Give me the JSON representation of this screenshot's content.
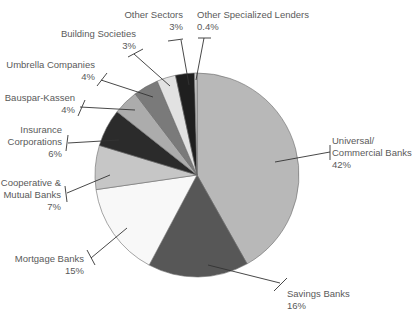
{
  "chart_data": {
    "type": "pie",
    "title": "",
    "start_angle_deg": 0,
    "direction": "clockwise",
    "legend": "none (callout labels)",
    "categories": [
      "Universal/ Commercial Banks",
      "Savings Banks",
      "Mortgage Banks",
      "Cooperative & Mutual Banks",
      "Insurance Corporations",
      "Bauspar-Kassen",
      "Umbrella Companies",
      "Building Societies",
      "Other Sectors",
      "Other Specialized Lenders"
    ],
    "values": [
      42,
      16,
      15,
      7,
      6,
      4,
      4,
      3,
      3,
      0.4
    ],
    "value_labels": [
      "42%",
      "16%",
      "15%",
      "7%",
      "6%",
      "4%",
      "4%",
      "3%",
      "3%",
      "0.4%"
    ],
    "colors": [
      "#b8b8b8",
      "#575757",
      "#f8f8f8",
      "#c6c6c6",
      "#2b2b2b",
      "#acacac",
      "#7a7a7a",
      "#e2e2e2",
      "#1f1f1f",
      "#cfcfcf"
    ]
  },
  "geometry": {
    "cx": 197,
    "cy": 175,
    "r": 102
  },
  "labels": [
    {
      "lines": [
        "Universal/",
        "Commercial Banks"
      ],
      "pct": "42%",
      "x": 332,
      "y": 144,
      "anchor": "start",
      "leader": [
        [
          275,
          162
        ],
        [
          330,
          152
        ]
      ],
      "tick": [
        [
          330,
          145
        ],
        [
          330,
          160
        ]
      ]
    },
    {
      "lines": [
        "Savings Banks"
      ],
      "pct": "16%",
      "x": 287,
      "y": 297,
      "anchor": "start",
      "leader": [
        [
          208,
          265
        ],
        [
          280,
          283
        ]
      ],
      "tick": [
        [
          274,
          291
        ],
        [
          287,
          278
        ]
      ]
    },
    {
      "lines": [
        "Mortgage Banks"
      ],
      "pct": "15%",
      "x": 84,
      "y": 262,
      "anchor": "end",
      "leader": [
        [
          127,
          228
        ],
        [
          91,
          258
        ]
      ],
      "tick": [
        [
          87,
          250
        ],
        [
          95,
          265
        ]
      ]
    },
    {
      "lines": [
        "Cooperative &",
        "Mutual Banks"
      ],
      "pct": "7%",
      "x": 61,
      "y": 186,
      "anchor": "end",
      "leader": [
        [
          110,
          175
        ],
        [
          67,
          193
        ]
      ],
      "tick": [
        [
          65,
          186
        ],
        [
          67,
          202
        ]
      ]
    },
    {
      "lines": [
        "Insurance",
        "Corporations"
      ],
      "pct": "6%",
      "x": 62,
      "y": 133,
      "anchor": "end",
      "leader": [
        [
          119,
          140
        ],
        [
          68,
          143
        ]
      ],
      "tick": [
        [
          68,
          135
        ],
        [
          66,
          151
        ]
      ]
    },
    {
      "lines": [
        "Bauspar-Kassen"
      ],
      "pct": "4%",
      "x": 75,
      "y": 101,
      "anchor": "end",
      "leader": [
        [
          135,
          110
        ],
        [
          80,
          107
        ]
      ],
      "tick": [
        [
          85,
          100
        ],
        [
          78,
          116
        ]
      ]
    },
    {
      "lines": [
        "Umbrella Companies"
      ],
      "pct": "4%",
      "x": 95,
      "y": 68,
      "anchor": "end",
      "leader": [
        [
          153,
          97
        ],
        [
          101,
          80
        ]
      ],
      "tick": [
        [
          107,
          73
        ],
        [
          97,
          86
        ]
      ]
    },
    {
      "lines": [
        "Building Societies"
      ],
      "pct": "3%",
      "x": 136,
      "y": 37,
      "anchor": "end",
      "leader": [
        [
          170,
          86
        ],
        [
          134,
          54
        ]
      ],
      "tick": [
        [
          128,
          57
        ],
        [
          143,
          49
        ]
      ]
    },
    {
      "lines": [
        "Other Sectors"
      ],
      "pct": "3%",
      "x": 183,
      "y": 18,
      "anchor": "end",
      "leader": [
        [
          189,
          85
        ],
        [
          181,
          40
        ]
      ],
      "tick": [
        [
          168,
          41
        ],
        [
          183,
          39
        ]
      ]
    },
    {
      "lines": [
        "Other Specialized Lenders"
      ],
      "pct": "0.4%",
      "x": 197,
      "y": 18,
      "anchor": "start",
      "leader": [
        [
          196,
          80
        ],
        [
          204,
          38
        ]
      ],
      "tick": [
        [
          198,
          38
        ],
        [
          211,
          38
        ]
      ]
    }
  ]
}
